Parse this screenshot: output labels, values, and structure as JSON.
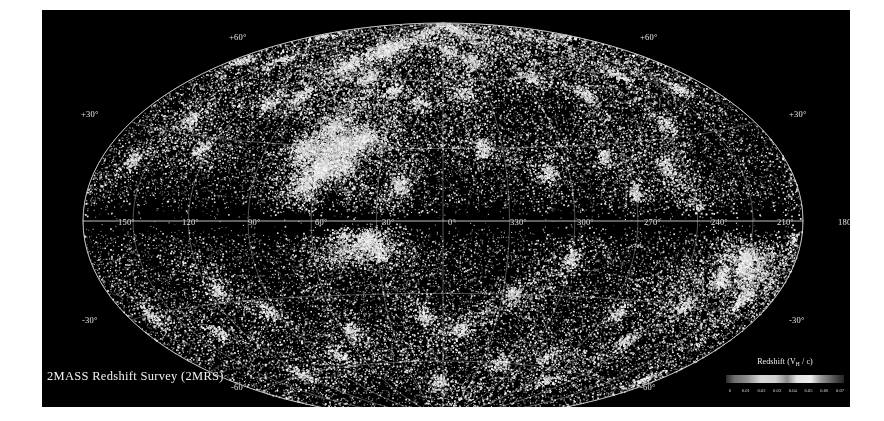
{
  "figure": {
    "title": "2MASS Redshift Survey (2MRS)",
    "background_color": "#000000",
    "page_background_color": "#ffffff"
  },
  "legend": {
    "title_main": "Redshift (V",
    "title_sub": "H",
    "title_end": " / c)",
    "title_full": "Redshift (VH / c)",
    "ticks": [
      "0",
      "0.01",
      "0.02",
      "0.03",
      "0.04",
      "0.05",
      "0.06",
      "0.07"
    ],
    "range": [
      0,
      0.075
    ]
  },
  "graticule": {
    "longitude_labels": [
      "150°",
      "120°",
      "90°",
      "60°",
      "30°",
      "0°",
      "330°",
      "300°",
      "270°",
      "240°",
      "210°",
      "180°"
    ],
    "latitude_labels_left": [
      "+60°",
      "+30°",
      "-30°",
      "-60°"
    ],
    "latitude_labels_right": [
      "+60°",
      "+30°",
      "-30°",
      "-60°"
    ],
    "line_color": "#b9b9b9"
  },
  "chart_data": {
    "type": "scatter",
    "title": "2MASS Redshift Survey (2MRS)",
    "projection": "aitoff",
    "coordinate_system": "galactic",
    "xlabel": "Galactic longitude l",
    "ylabel": "Galactic latitude b",
    "xlim": [
      180,
      -180
    ],
    "ylim": [
      -90,
      90
    ],
    "grid": true,
    "legend_position": "bottom-right",
    "colorbar": {
      "label": "Redshift (VH / c)",
      "ticks": [
        0,
        0.01,
        0.02,
        0.03,
        0.04,
        0.05,
        0.06,
        0.07
      ],
      "vmin": 0,
      "vmax": 0.075
    },
    "x_tick_labels": [
      "150°",
      "120°",
      "90°",
      "60°",
      "30°",
      "0°",
      "330°",
      "300°",
      "270°",
      "240°",
      "210°",
      "180°"
    ],
    "x_tick_values": [
      150,
      120,
      90,
      60,
      30,
      0,
      330,
      300,
      270,
      240,
      210,
      180
    ],
    "y_tick_labels": [
      "+60°",
      "+30°",
      "-30°",
      "-60°"
    ],
    "y_tick_values": [
      60,
      30,
      -30,
      -60
    ],
    "point_count_approx": 44000,
    "point_color": "#ffffff",
    "annotations": [
      {
        "text": "Zone of Avoidance",
        "description": "dark horizontal band of missing galaxies along galactic latitude b = 0"
      }
    ],
    "overdensities": [
      {
        "name": "Shapley Supercluster",
        "l": 306,
        "b": 30
      },
      {
        "name": "Perseus-Pisces",
        "l": 150,
        "b": -13
      },
      {
        "name": "Great Attractor / Norma",
        "l": 325,
        "b": -7
      },
      {
        "name": "Coma Cluster",
        "l": 58,
        "b": 88
      },
      {
        "name": "Virgo Cluster",
        "l": 284,
        "b": 74
      },
      {
        "name": "Hydra-Centaurus",
        "l": 302,
        "b": 21
      }
    ]
  }
}
